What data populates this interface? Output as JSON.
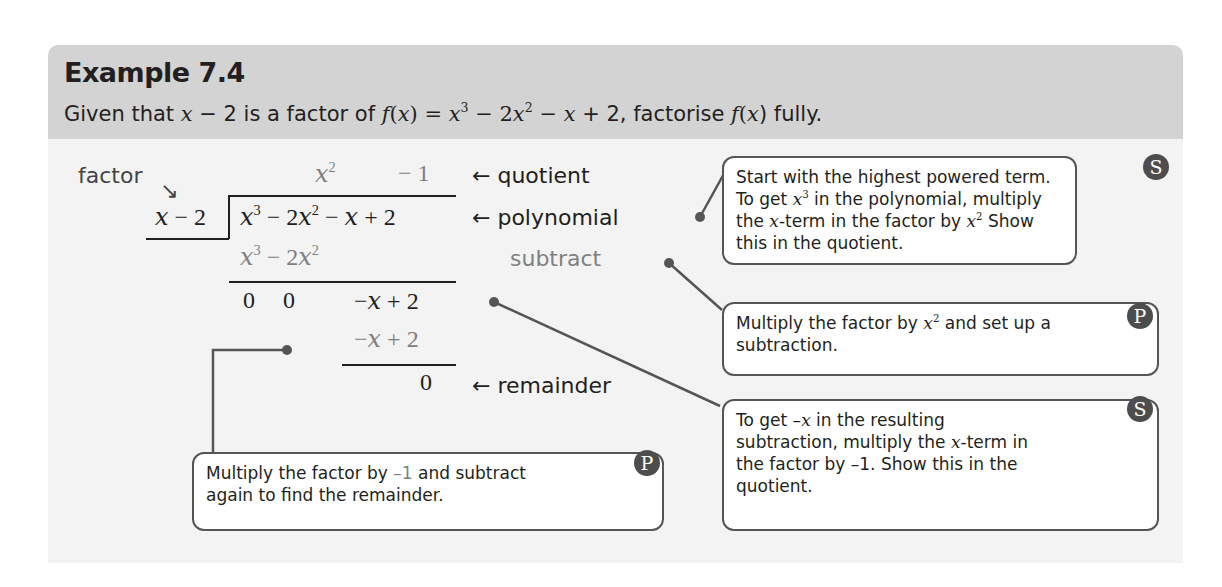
{
  "example": {
    "title": "Example 7.4",
    "question": {
      "p1": "Given that ",
      "m1": "x",
      "p2": " − 2 is a factor of ",
      "m2": "f",
      "p3": "(",
      "m3": "x",
      "p4": ") = ",
      "m4": "x",
      "s4": "3",
      "p5": " − 2",
      "m5": "x",
      "s5": "2",
      "p6": " − ",
      "m6": "x",
      "p7": " + 2, factorise ",
      "m7": "f",
      "p8": "(",
      "m8": "x",
      "p9": ") fully."
    }
  },
  "division": {
    "factor_label": "factor",
    "factor_arrow": "↘",
    "divisor": {
      "var": "x",
      "rest": " − 2"
    },
    "quotient": {
      "t1_var": "x",
      "t1_exp": "2",
      "t2": "− 1"
    },
    "dividend": {
      "a": "x",
      "a_exp": "3",
      "b": " − 2",
      "c": "x",
      "c_exp": "2",
      "d": " − ",
      "e": "x",
      "f": " + 2"
    },
    "sub1": {
      "a": "x",
      "a_exp": "3",
      "b": " − 2",
      "c": "x",
      "c_exp": "2"
    },
    "result1": {
      "z1": "0",
      "z2": "0",
      "neg": "−",
      "var": "x",
      "rest": " + 2"
    },
    "sub2": {
      "neg": "−",
      "var": "x",
      "rest": " + 2"
    },
    "remainder_value": "0",
    "labels": {
      "quotient": "← quotient",
      "polynomial": "← polynomial",
      "subtract": "subtract",
      "remainder": "← remainder"
    }
  },
  "callouts": [
    {
      "badge": "S",
      "parts": [
        "Start with the highest powered term. To get ",
        "x",
        "3",
        " in the polynomial, multiply the ",
        "x",
        "-term in the factor by ",
        "x",
        "2",
        " Show this in the quotient."
      ]
    },
    {
      "badge": "P",
      "parts": [
        "Multiply the factor by ",
        "x",
        "2",
        " and set up a subtraction."
      ]
    },
    {
      "badge": "S",
      "parts": [
        "To get –",
        "x",
        " in the resulting subtraction, multiply the ",
        "x",
        "-term in the factor by –1. Show this in the quotient."
      ]
    },
    {
      "badge": "P",
      "parts": [
        "Multiply the factor by ",
        "–1",
        " and subtract again to find the remainder."
      ]
    }
  ],
  "colors": {
    "header_bg": "#d3d3d3",
    "body_bg": "#f3f3f3",
    "badge_bg": "#4d4d4d",
    "connector": "#555555",
    "muted_text": "#808080"
  }
}
